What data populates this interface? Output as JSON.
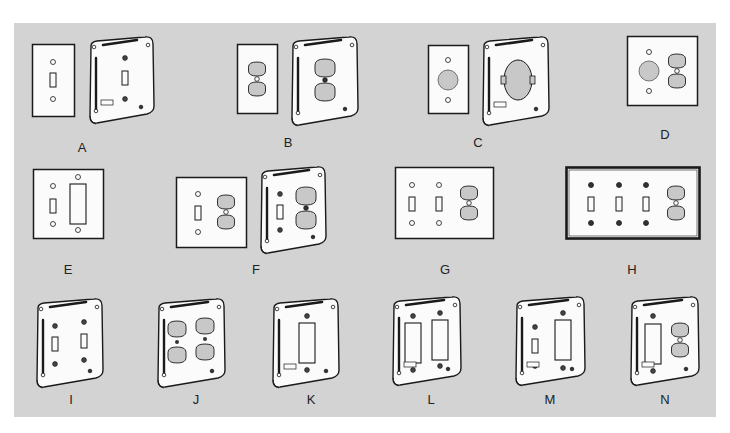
{
  "figure": {
    "background_color": "#d3d3d3",
    "items": [
      {
        "label": "A",
        "label_pos": [
          82,
          140
        ],
        "parts": [
          {
            "kind": "flat",
            "x": 32,
            "y": 44,
            "w": 43,
            "h": 73,
            "devices": [
              {
                "t": "toggle",
                "cx": 21,
                "cy": 36
              }
            ],
            "screws": [
              [
                21,
                18
              ],
              [
                21,
                55
              ]
            ]
          },
          {
            "kind": "box",
            "x": 87,
            "y": 36,
            "w": 68,
            "h": 88,
            "devices": [
              {
                "t": "toggle",
                "cx": 38,
                "cy": 42
              }
            ],
            "screws": [
              [
                38,
                22
              ],
              [
                38,
                63
              ]
            ],
            "tag": true
          }
        ]
      },
      {
        "label": "B",
        "label_pos": [
          288,
          135
        ],
        "parts": [
          {
            "kind": "flat",
            "x": 237,
            "y": 44,
            "w": 41,
            "h": 70,
            "devices": [
              {
                "t": "duplex",
                "cx": 20,
                "cy": 35
              }
            ],
            "screws": []
          },
          {
            "kind": "box",
            "x": 289,
            "y": 36,
            "w": 70,
            "h": 90,
            "devices": [
              {
                "t": "duplex-lg",
                "cx": 36,
                "cy": 44
              }
            ],
            "screws": []
          }
        ]
      },
      {
        "label": "C",
        "label_pos": [
          478,
          135
        ],
        "parts": [
          {
            "kind": "flat",
            "x": 428,
            "y": 45,
            "w": 41,
            "h": 69,
            "devices": [
              {
                "t": "round",
                "cx": 20,
                "cy": 35
              }
            ],
            "screws": [
              [
                20,
                15
              ],
              [
                20,
                55
              ]
            ]
          },
          {
            "kind": "box",
            "x": 480,
            "y": 36,
            "w": 70,
            "h": 90,
            "devices": [
              {
                "t": "single-recept",
                "cx": 38,
                "cy": 44
              }
            ],
            "screws": [],
            "tag": true
          }
        ]
      },
      {
        "label": "D",
        "label_pos": [
          665,
          127
        ],
        "parts": [
          {
            "kind": "flat",
            "x": 627,
            "y": 36,
            "w": 71,
            "h": 70,
            "devices": [
              {
                "t": "round",
                "cx": 22,
                "cy": 35
              },
              {
                "t": "duplex",
                "cx": 50,
                "cy": 35
              }
            ],
            "screws": [
              [
                22,
                16
              ],
              [
                22,
                55
              ]
            ]
          }
        ]
      },
      {
        "label": "E",
        "label_pos": [
          68,
          262
        ],
        "parts": [
          {
            "kind": "flat",
            "x": 33,
            "y": 169,
            "w": 71,
            "h": 70,
            "devices": [
              {
                "t": "toggle",
                "cx": 20,
                "cy": 37
              },
              {
                "t": "decora",
                "cx": 45,
                "cy": 35
              }
            ],
            "screws": [
              [
                20,
                17
              ],
              [
                20,
                55
              ],
              [
                45,
                8
              ],
              [
                45,
                61
              ]
            ]
          }
        ]
      },
      {
        "label": "F",
        "label_pos": [
          256,
          262
        ],
        "parts": [
          {
            "kind": "flat",
            "x": 176,
            "y": 177,
            "w": 71,
            "h": 71,
            "devices": [
              {
                "t": "toggle",
                "cx": 22,
                "cy": 36
              },
              {
                "t": "duplex",
                "cx": 50,
                "cy": 35
              }
            ],
            "screws": [
              [
                22,
                17
              ],
              [
                22,
                55
              ]
            ]
          },
          {
            "kind": "box",
            "x": 258,
            "y": 166,
            "w": 69,
            "h": 88,
            "devices": [
              {
                "t": "toggle",
                "cx": 22,
                "cy": 46
              },
              {
                "t": "duplex-lg",
                "cx": 48,
                "cy": 42
              }
            ],
            "screws": [
              [
                22,
                28
              ],
              [
                22,
                64
              ]
            ]
          }
        ]
      },
      {
        "label": "G",
        "label_pos": [
          445,
          262
        ],
        "parts": [
          {
            "kind": "flat",
            "x": 395,
            "y": 167,
            "w": 99,
            "h": 72,
            "devices": [
              {
                "t": "toggle",
                "cx": 17,
                "cy": 37
              },
              {
                "t": "toggle",
                "cx": 44,
                "cy": 37
              },
              {
                "t": "duplex",
                "cx": 74,
                "cy": 36
              }
            ],
            "screws": [
              [
                17,
                18
              ],
              [
                17,
                56
              ],
              [
                44,
                18
              ],
              [
                44,
                56
              ]
            ]
          }
        ]
      },
      {
        "label": "H",
        "label_pos": [
          632,
          262
        ],
        "parts": [
          {
            "kind": "flat-heavy",
            "x": 566,
            "y": 167,
            "w": 134,
            "h": 72,
            "devices": [
              {
                "t": "toggle",
                "cx": 25,
                "cy": 37
              },
              {
                "t": "toggle",
                "cx": 53,
                "cy": 37
              },
              {
                "t": "toggle",
                "cx": 80,
                "cy": 37
              },
              {
                "t": "duplex",
                "cx": 110,
                "cy": 36
              }
            ],
            "screws": [
              [
                25,
                18
              ],
              [
                25,
                56
              ],
              [
                53,
                18
              ],
              [
                53,
                56
              ],
              [
                80,
                18
              ],
              [
                80,
                56
              ]
            ],
            "dark_screws": true
          }
        ]
      },
      {
        "label": "I",
        "label_pos": [
          71,
          392
        ],
        "parts": [
          {
            "kind": "box",
            "x": 34,
            "y": 298,
            "w": 70,
            "h": 90,
            "devices": [
              {
                "t": "toggle",
                "cx": 21,
                "cy": 46
              },
              {
                "t": "toggle",
                "cx": 50,
                "cy": 43
              }
            ],
            "screws": [
              [
                21,
                28
              ],
              [
                21,
                66
              ],
              [
                50,
                24
              ],
              [
                50,
                62
              ]
            ]
          }
        ]
      },
      {
        "label": "J",
        "label_pos": [
          196,
          392
        ],
        "parts": [
          {
            "kind": "box",
            "x": 155,
            "y": 298,
            "w": 71,
            "h": 90,
            "devices": [
              {
                "t": "duplex-sm",
                "cx": 22,
                "cy": 44
              },
              {
                "t": "duplex-sm",
                "cx": 50,
                "cy": 41
              }
            ],
            "screws": []
          }
        ]
      },
      {
        "label": "K",
        "label_pos": [
          311,
          392
        ],
        "parts": [
          {
            "kind": "box",
            "x": 270,
            "y": 298,
            "w": 70,
            "h": 90,
            "devices": [
              {
                "t": "decora",
                "cx": 37,
                "cy": 45
              }
            ],
            "screws": [
              [
                37,
                18
              ],
              [
                37,
                72
              ]
            ],
            "tag": true
          }
        ]
      },
      {
        "label": "L",
        "label_pos": [
          431,
          392
        ],
        "parts": [
          {
            "kind": "box",
            "x": 390,
            "y": 296,
            "w": 72,
            "h": 90,
            "devices": [
              {
                "t": "decora",
                "cx": 23,
                "cy": 47
              },
              {
                "t": "decora",
                "cx": 50,
                "cy": 44
              }
            ],
            "screws": [
              [
                23,
                20
              ],
              [
                50,
                17
              ],
              [
                23,
                74
              ],
              [
                50,
                70
              ]
            ],
            "tag": true
          }
        ]
      },
      {
        "label": "M",
        "label_pos": [
          550,
          392
        ],
        "parts": [
          {
            "kind": "box",
            "x": 513,
            "y": 296,
            "w": 73,
            "h": 90,
            "devices": [
              {
                "t": "toggle",
                "cx": 22,
                "cy": 50
              },
              {
                "t": "decora",
                "cx": 50,
                "cy": 44
              }
            ],
            "screws": [
              [
                22,
                31
              ],
              [
                22,
                70
              ],
              [
                50,
                17
              ],
              [
                50,
                72
              ]
            ],
            "tag": true
          }
        ]
      },
      {
        "label": "N",
        "label_pos": [
          665,
          392
        ],
        "parts": [
          {
            "kind": "box",
            "x": 628,
            "y": 296,
            "w": 72,
            "h": 90,
            "devices": [
              {
                "t": "decora",
                "cx": 25,
                "cy": 48
              },
              {
                "t": "duplex",
                "cx": 52,
                "cy": 44
              }
            ],
            "screws": [
              [
                25,
                20
              ],
              [
                25,
                75
              ]
            ],
            "tag": true
          }
        ]
      }
    ]
  }
}
